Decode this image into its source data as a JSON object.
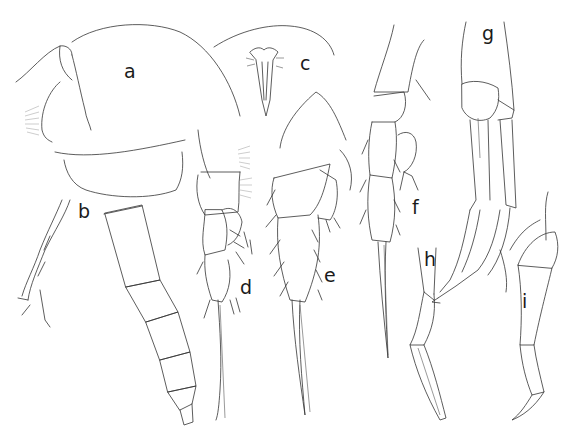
{
  "figure": {
    "background_color": "#ffffff",
    "line_color": "#333333",
    "panels": [
      {
        "label": "a",
        "subject": "habitus, cephalothorax (lateral)"
      },
      {
        "label": "b",
        "subject": "antennule / urosome"
      },
      {
        "label": "c",
        "subject": "rostrum"
      },
      {
        "label": "d",
        "subject": "swimming leg"
      },
      {
        "label": "e",
        "subject": "swimming leg"
      },
      {
        "label": "f",
        "subject": "swimming leg"
      },
      {
        "label": "g",
        "subject": "appendage"
      },
      {
        "label": "h",
        "subject": "appendage"
      },
      {
        "label": "i",
        "subject": "appendage"
      }
    ]
  }
}
